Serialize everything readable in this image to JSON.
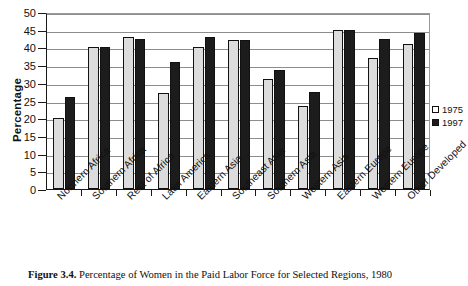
{
  "figure": {
    "caption_label": "Figure 3.4.",
    "caption_text": "Percentage of Women in the Paid Labor Force for Selected Regions, 1980"
  },
  "legend": {
    "position": "right",
    "entries": [
      {
        "label": "1975",
        "color": "#dcdcdc"
      },
      {
        "label": "1997",
        "color": "#1c1c1c"
      }
    ]
  },
  "axis": {
    "ylabel": "Percentage",
    "yticks": [
      "0",
      "5",
      "10",
      "15",
      "20",
      "25",
      "30",
      "35",
      "40",
      "45",
      "50"
    ]
  },
  "chart_data": {
    "type": "bar",
    "title": "Percentage of Women in the Paid Labor Force for Selected Regions, 1980",
    "xlabel": "",
    "ylabel": "Percentage",
    "ylim": [
      0,
      50
    ],
    "ytick_step": 5,
    "grid": true,
    "legend_position": "right",
    "categories": [
      "Northern Africa",
      "Southern Africa",
      "Rest of Africa",
      "Latin America",
      "Eastern Asia",
      "Southeast Asia",
      "Southern Asia",
      "Western Asia",
      "Eastern Europe",
      "Western Europe",
      "Other Developed"
    ],
    "series": [
      {
        "name": "1975",
        "color": "#dcdcdc",
        "values": [
          20,
          40,
          43,
          27,
          40,
          42,
          31,
          23.5,
          45,
          37,
          41
        ]
      },
      {
        "name": "1997",
        "color": "#1c1c1c",
        "values": [
          26,
          40,
          42.5,
          36,
          43,
          42,
          33.5,
          27.5,
          45,
          42.5,
          44
        ]
      }
    ]
  }
}
